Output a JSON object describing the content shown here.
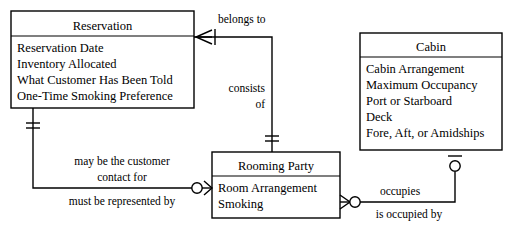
{
  "diagram": {
    "notation": "crow's-foot",
    "background_color": "#ffffff",
    "line_color": "#000000"
  },
  "entities": {
    "reservation": {
      "name": "Reservation",
      "attributes": [
        "Reservation Date",
        "Inventory Allocated",
        "What Customer Has Been Told",
        "One-Time Smoking Preference"
      ]
    },
    "cabin": {
      "name": "Cabin",
      "attributes": [
        "Cabin Arrangement",
        "Maximum Occupancy",
        "Port or Starboard",
        "Deck",
        "Fore, Aft, or Amidships"
      ]
    },
    "rooming_party": {
      "name": "Rooming Party",
      "attributes": [
        "Room Arrangement",
        "Smoking"
      ]
    }
  },
  "relationships": {
    "belongs_to": {
      "label": "belongs to"
    },
    "consists_of": {
      "label_line1": "consists",
      "label_line2": "of"
    },
    "customer_contact": {
      "label_line1": "may be the customer",
      "label_line2": "contact for"
    },
    "represented_by": {
      "label": "must be represented by"
    },
    "occupies": {
      "label": "occupies"
    },
    "is_occupied_by": {
      "label": "is occupied by"
    }
  }
}
